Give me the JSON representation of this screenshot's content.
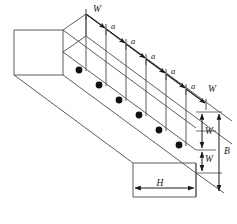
{
  "figure": {
    "name": "inclined-beam-point-loads-diagram",
    "type": "isometric-engineering-diagram",
    "colors": {
      "line": "#3a3a3a",
      "load_line": "#1a1a1a",
      "node": "#111111",
      "background": "#ffffff",
      "text": "#1a1a1a"
    }
  },
  "labels": {
    "load_start": "W",
    "load_end": "W",
    "spacing": "a",
    "width_w_upper": "W",
    "width_w_lower": "W",
    "total_b": "B",
    "height_h": "H"
  },
  "spacing_labels": [
    "a",
    "a",
    "a",
    "a",
    "a"
  ],
  "load_nodes": [
    {
      "index": 1,
      "label": ""
    },
    {
      "index": 2,
      "label": ""
    },
    {
      "index": 3,
      "label": ""
    },
    {
      "index": 4,
      "label": ""
    },
    {
      "index": 5,
      "label": ""
    },
    {
      "index": 6,
      "label": ""
    }
  ],
  "dimensions": {
    "vertical_stack": [
      "W",
      "W"
    ],
    "total_depth": "B",
    "horizontal_width": "H"
  }
}
